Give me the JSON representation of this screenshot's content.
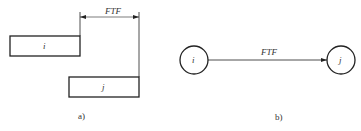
{
  "panel_a": {
    "activity_i": "i",
    "activity_j": "j",
    "relation_label": "FTF",
    "caption": "a)"
  },
  "panel_b": {
    "node_i": "i",
    "node_j": "j",
    "relation_label": "FTF",
    "caption": "b)"
  },
  "colors": {
    "stroke": "#222222",
    "background": "#ffffff"
  }
}
